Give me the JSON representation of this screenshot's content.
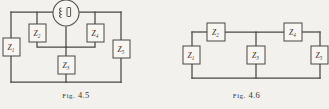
{
  "page": {
    "background_color": "#f2f1ee",
    "ink_color": "#4a4742"
  },
  "figures": [
    {
      "id": "fig-4-5",
      "caption_prefix": "Fig.",
      "caption_number": "4.5",
      "caption_full": "Fig. 4.5",
      "type": "circuit-diagram",
      "description": "bridge circuit with source",
      "source": {
        "name": "generator-source",
        "symbol": "coil-in-circle",
        "label": ""
      },
      "components": [
        {
          "name": "impedance-z1",
          "label": "Z",
          "subscript": "1"
        },
        {
          "name": "impedance-z2",
          "label": "Z",
          "subscript": "2"
        },
        {
          "name": "impedance-z3",
          "label": "Z",
          "subscript": "3"
        },
        {
          "name": "impedance-z4",
          "label": "Z",
          "subscript": "4"
        },
        {
          "name": "impedance-z5",
          "label": "Z",
          "subscript": "5"
        }
      ]
    },
    {
      "id": "fig-4-6",
      "caption_prefix": "Fig.",
      "caption_number": "4.6",
      "caption_full": "Fig. 4.6",
      "type": "circuit-diagram",
      "description": "ladder network of five impedances",
      "components": [
        {
          "name": "impedance-z1",
          "label": "Z",
          "subscript": "1"
        },
        {
          "name": "impedance-z2",
          "label": "Z",
          "subscript": "2"
        },
        {
          "name": "impedance-z3",
          "label": "Z",
          "subscript": "3"
        },
        {
          "name": "impedance-z4",
          "label": "Z",
          "subscript": "4"
        },
        {
          "name": "impedance-z5",
          "label": "Z",
          "subscript": "5"
        }
      ]
    }
  ]
}
